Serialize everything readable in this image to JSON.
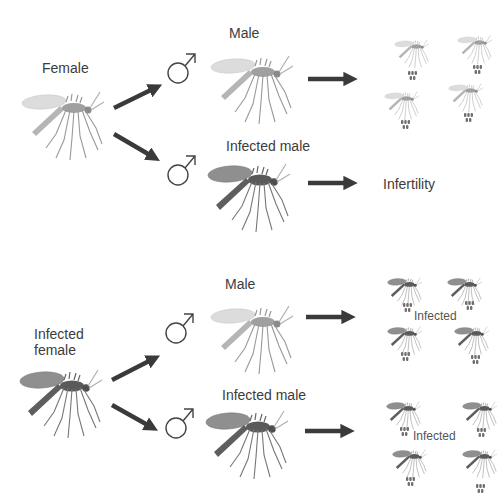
{
  "colors": {
    "background": "#ffffff",
    "arrow": "#3a3a3a",
    "text": "#3c3c3c",
    "normal_body": "#a8a8a8",
    "normal_wing": "#d9d9d9",
    "infected_body": "#6a6a6a",
    "infected_wing": "#8e8e8e",
    "egg": "#707070"
  },
  "top_panel": {
    "parent_label": "Female",
    "parent_type": "normal",
    "branches": [
      {
        "symbol": "male-symbol",
        "label": "Male",
        "male_type": "normal",
        "outcome_type": "offspring",
        "offspring_type": "normal",
        "outcome_label": ""
      },
      {
        "symbol": "male-symbol",
        "label": "Infected male",
        "male_type": "infected",
        "outcome_type": "text",
        "outcome_label": "Infertility"
      }
    ]
  },
  "bottom_panel": {
    "parent_label_line1": "Infected",
    "parent_label_line2": "female",
    "parent_type": "infected",
    "branches": [
      {
        "symbol": "male-symbol",
        "label": "Male",
        "male_type": "normal",
        "outcome_type": "offspring",
        "offspring_type": "infected",
        "outcome_label": "Infected"
      },
      {
        "symbol": "male-symbol",
        "label": "Infected male",
        "male_type": "infected",
        "outcome_type": "offspring",
        "offspring_type": "infected",
        "outcome_label": "Infected"
      }
    ]
  }
}
